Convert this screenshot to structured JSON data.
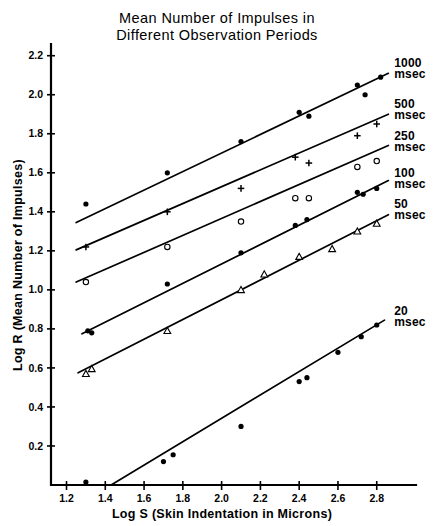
{
  "chart_data": {
    "type": "scatter",
    "title": "Mean Number of Impulses in Different Observation Periods",
    "title_line1": "Mean Number of Impulses in",
    "title_line2": "Different Observation Periods",
    "xlabel": "Log S  (Skin Indentation in Microns)",
    "ylabel": "Log R  (Mean Number of Impulses)",
    "xlim": [
      1.12,
      2.92
    ],
    "ylim": [
      0.0,
      2.26
    ],
    "xticks": [
      1.2,
      1.4,
      1.6,
      1.8,
      2.0,
      2.2,
      2.4,
      2.6,
      2.8
    ],
    "xticklabels": [
      "1.2",
      "1.4",
      "1.6",
      "1.8",
      "2.0",
      "2.2",
      "2.4",
      "2.6",
      "2.8"
    ],
    "yticks": [
      0.2,
      0.4,
      0.6,
      0.8,
      1.0,
      1.2,
      1.4,
      1.6,
      1.8,
      2.0,
      2.2
    ],
    "yticklabels": [
      "0.2",
      "0.4",
      "0.6",
      "0.8",
      "1.0",
      "1.2",
      "1.4",
      "1.6",
      "1.8",
      "2.0",
      "2.2"
    ],
    "grid": false,
    "legend_position": "right-inline",
    "series": [
      {
        "name": "1000 msec",
        "label_line1": "1000",
        "label_line2": "msec",
        "marker": "filled-circle",
        "label_x": 2.88,
        "label_y": 2.14,
        "fit_line": {
          "x0": 1.25,
          "y0": 1.345,
          "x1": 2.86,
          "y1": 2.11
        },
        "points": [
          {
            "x": 1.3,
            "y": 1.44
          },
          {
            "x": 1.72,
            "y": 1.6
          },
          {
            "x": 2.1,
            "y": 1.76
          },
          {
            "x": 2.4,
            "y": 1.91
          },
          {
            "x": 2.45,
            "y": 1.89
          },
          {
            "x": 2.7,
            "y": 2.05
          },
          {
            "x": 2.74,
            "y": 2.0
          },
          {
            "x": 2.82,
            "y": 2.09
          }
        ]
      },
      {
        "name": "500 msec",
        "label_line1": "500",
        "label_line2": "msec",
        "marker": "plus",
        "label_x": 2.88,
        "label_y": 1.93,
        "fit_line": {
          "x0": 1.25,
          "y0": 1.205,
          "x1": 2.86,
          "y1": 1.9
        },
        "points": [
          {
            "x": 1.3,
            "y": 1.22
          },
          {
            "x": 1.72,
            "y": 1.4
          },
          {
            "x": 2.1,
            "y": 1.52
          },
          {
            "x": 2.38,
            "y": 1.68
          },
          {
            "x": 2.45,
            "y": 1.65
          },
          {
            "x": 2.7,
            "y": 1.79
          },
          {
            "x": 2.8,
            "y": 1.85
          }
        ]
      },
      {
        "name": "250 msec",
        "label_line1": "250",
        "label_line2": "msec",
        "marker": "open-circle",
        "label_x": 2.88,
        "label_y": 1.77,
        "fit_line": {
          "x0": 1.25,
          "y0": 1.04,
          "x1": 2.86,
          "y1": 1.74
        },
        "points": [
          {
            "x": 1.3,
            "y": 1.04
          },
          {
            "x": 1.72,
            "y": 1.22
          },
          {
            "x": 2.1,
            "y": 1.35
          },
          {
            "x": 2.38,
            "y": 1.47
          },
          {
            "x": 2.45,
            "y": 1.47
          },
          {
            "x": 2.7,
            "y": 1.63
          },
          {
            "x": 2.8,
            "y": 1.66
          }
        ]
      },
      {
        "name": "100 msec",
        "label_line1": "100",
        "label_line2": "msec",
        "marker": "filled-circle",
        "label_x": 2.88,
        "label_y": 1.58,
        "fit_line": {
          "x0": 1.28,
          "y0": 0.775,
          "x1": 2.86,
          "y1": 1.56
        },
        "points": [
          {
            "x": 1.31,
            "y": 0.79
          },
          {
            "x": 1.33,
            "y": 0.78
          },
          {
            "x": 1.72,
            "y": 1.03
          },
          {
            "x": 2.1,
            "y": 1.19
          },
          {
            "x": 2.38,
            "y": 1.33
          },
          {
            "x": 2.44,
            "y": 1.36
          },
          {
            "x": 2.7,
            "y": 1.5
          },
          {
            "x": 2.73,
            "y": 1.49
          },
          {
            "x": 2.8,
            "y": 1.52
          }
        ]
      },
      {
        "name": "50 msec",
        "label_line1": "50",
        "label_line2": "msec",
        "marker": "open-triangle",
        "label_x": 2.88,
        "label_y": 1.42,
        "fit_line": {
          "x0": 1.26,
          "y0": 0.575,
          "x1": 2.86,
          "y1": 1.385
        },
        "points": [
          {
            "x": 1.3,
            "y": 0.57
          },
          {
            "x": 1.33,
            "y": 0.595
          },
          {
            "x": 1.72,
            "y": 0.79
          },
          {
            "x": 2.1,
            "y": 1.0
          },
          {
            "x": 2.22,
            "y": 1.08
          },
          {
            "x": 2.4,
            "y": 1.17
          },
          {
            "x": 2.57,
            "y": 1.21
          },
          {
            "x": 2.7,
            "y": 1.3
          },
          {
            "x": 2.8,
            "y": 1.34
          }
        ]
      },
      {
        "name": "20 msec",
        "label_line1": "20",
        "label_line2": "msec",
        "marker": "filled-circle",
        "label_x": 2.88,
        "label_y": 0.87,
        "fit_line": {
          "x0": 1.43,
          "y0": 0.0,
          "x1": 2.84,
          "y1": 0.845
        },
        "points": [
          {
            "x": 1.3,
            "y": 0.015
          },
          {
            "x": 1.7,
            "y": 0.12
          },
          {
            "x": 1.75,
            "y": 0.155
          },
          {
            "x": 2.1,
            "y": 0.3
          },
          {
            "x": 2.4,
            "y": 0.53
          },
          {
            "x": 2.44,
            "y": 0.55
          },
          {
            "x": 2.6,
            "y": 0.68
          },
          {
            "x": 2.72,
            "y": 0.76
          },
          {
            "x": 2.8,
            "y": 0.82
          }
        ]
      }
    ]
  }
}
